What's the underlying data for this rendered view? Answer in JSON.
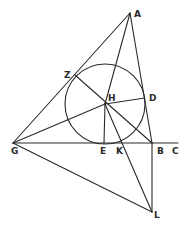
{
  "diagram": {
    "type": "geometric-construction",
    "stroke_color": "#2a2a2a",
    "background": "#ffffff",
    "points": {
      "A": {
        "x": 130,
        "y": 13,
        "label": "A"
      },
      "Z": {
        "x": 75,
        "y": 75,
        "label": "Z"
      },
      "H": {
        "x": 105,
        "y": 104,
        "label": "H"
      },
      "D": {
        "x": 145,
        "y": 98,
        "label": "D"
      },
      "G": {
        "x": 13,
        "y": 143,
        "label": "G"
      },
      "E": {
        "x": 104,
        "y": 143,
        "label": "E"
      },
      "K": {
        "x": 120,
        "y": 143,
        "label": "K"
      },
      "B": {
        "x": 152,
        "y": 143,
        "label": "B"
      },
      "C": {
        "x": 178,
        "y": 143,
        "label": "C"
      },
      "L": {
        "x": 152,
        "y": 212,
        "label": "L"
      }
    },
    "circle": {
      "center": "H",
      "radius": 40
    },
    "segments": [
      [
        "A",
        "G"
      ],
      [
        "A",
        "B"
      ],
      [
        "A",
        "H"
      ],
      [
        "G",
        "C"
      ],
      [
        "G",
        "H"
      ],
      [
        "G",
        "L"
      ],
      [
        "B",
        "L"
      ],
      [
        "Z",
        "B"
      ],
      [
        "H",
        "D"
      ],
      [
        "H",
        "E"
      ],
      [
        "H",
        "L"
      ]
    ]
  }
}
